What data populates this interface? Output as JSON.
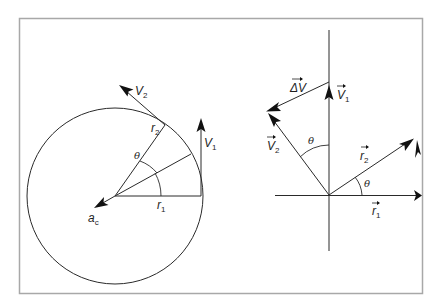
{
  "figure": {
    "left_diagram": {
      "labels": {
        "v2": "V",
        "v2_sub": "2",
        "v1": "V",
        "v1_sub": "1",
        "r2": "r",
        "r2_sub": "2",
        "r1": "r",
        "r1_sub": "1",
        "theta": "θ",
        "ac": "a",
        "ac_sub": "c"
      }
    },
    "right_diagram": {
      "labels": {
        "delta_v": "ΔV",
        "v1": "V",
        "v1_sub": "1",
        "v2": "V",
        "v2_sub": "2",
        "r2": "r",
        "r2_sub": "2",
        "r1": "r",
        "r1_sub": "1",
        "theta_top": "θ",
        "theta_bottom": "θ"
      }
    }
  }
}
